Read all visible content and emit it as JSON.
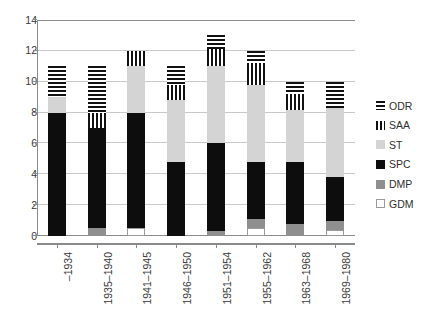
{
  "chart_data": {
    "type": "bar",
    "subtype": "stacked-vertical",
    "title": "",
    "subtitle": "",
    "xlabel": "",
    "ylabel": "",
    "ylim": [
      0,
      14
    ],
    "ytick_step": 2,
    "yticks": [
      0,
      2,
      4,
      6,
      8,
      10,
      12,
      14
    ],
    "ytick_labels": [
      "0",
      "2",
      "4",
      "6",
      "8",
      "10",
      "12",
      "14"
    ],
    "grid": "horizontal",
    "legend_position": "right",
    "categories": [
      "–1934",
      "1935–1940",
      "1941–1945",
      "1946–1950",
      "1951–1954",
      "1955–1962",
      "1963–1968",
      "1969–1980"
    ],
    "stack_order_bottom_to_top": [
      "GDM",
      "DMP",
      "SPC",
      "ST",
      "SAA",
      "ODR"
    ],
    "series": [
      {
        "name": "GDM",
        "color": "#ffffff",
        "pattern": "solid-outline",
        "values": [
          0,
          0,
          0.5,
          0,
          0,
          0.5,
          0,
          0.4
        ]
      },
      {
        "name": "DMP",
        "color": "#8f8f8f",
        "pattern": "solid",
        "values": [
          0,
          0.5,
          0,
          0,
          0.3,
          0.6,
          0.8,
          0.6
        ]
      },
      {
        "name": "SPC",
        "color": "#0d0d0d",
        "pattern": "solid",
        "values": [
          8.0,
          6.5,
          7.5,
          4.8,
          5.7,
          3.7,
          4.0,
          2.8
        ]
      },
      {
        "name": "ST",
        "color": "#d4d4d4",
        "pattern": "solid",
        "values": [
          1.0,
          0,
          3.0,
          4.0,
          5.0,
          5.0,
          3.4,
          4.5
        ]
      },
      {
        "name": "SAA",
        "color": "#111111",
        "pattern": "vertical-stripes",
        "values": [
          0,
          1.0,
          1.0,
          1.0,
          1.1,
          1.4,
          1.0,
          0
        ]
      },
      {
        "name": "ODR",
        "color": "#111111",
        "pattern": "horizontal-stripes",
        "values": [
          2.0,
          3.0,
          0,
          1.2,
          0.9,
          0.8,
          0.8,
          1.7
        ]
      }
    ],
    "totals": [
      11.0,
      11.0,
      12.0,
      11.0,
      13.0,
      12.0,
      10.0,
      10.0
    ]
  },
  "legend": {
    "items": [
      {
        "label": "ODR",
        "key": "ODR"
      },
      {
        "label": "SAA",
        "key": "SAA"
      },
      {
        "label": "ST",
        "key": "ST"
      },
      {
        "label": "SPC",
        "key": "SPC"
      },
      {
        "label": "DMP",
        "key": "DMP"
      },
      {
        "label": "GDM",
        "key": "GDM"
      }
    ]
  },
  "colors": {
    "axis": "#8a8a8a",
    "grid": "#c9c9c9",
    "text": "#3a3a3a",
    "background": "#ffffff"
  }
}
